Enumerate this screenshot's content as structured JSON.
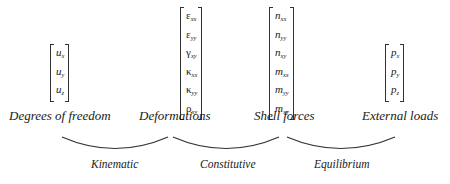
{
  "vectors": {
    "dof": {
      "entries": [
        {
          "sym": "u",
          "sub": "x"
        },
        {
          "sym": "u",
          "sub": "y"
        },
        {
          "sym": "u",
          "sub": "z"
        }
      ]
    },
    "deformations": {
      "entries": [
        {
          "sym": "ε",
          "sub": "xx"
        },
        {
          "sym": "ε",
          "sub": "yy"
        },
        {
          "sym": "γ",
          "sub": "xy"
        },
        {
          "sym": "κ",
          "sub": "xx"
        },
        {
          "sym": "κ",
          "sub": "yy"
        },
        {
          "sym": "ρ",
          "sub": "xy"
        }
      ]
    },
    "shell_forces": {
      "entries": [
        {
          "sym": "n",
          "sub": "xx"
        },
        {
          "sym": "n",
          "sub": "yy"
        },
        {
          "sym": "n",
          "sub": "xy"
        },
        {
          "sym": "m",
          "sub": "xx"
        },
        {
          "sym": "m",
          "sub": "yy"
        },
        {
          "sym": "m",
          "sub": "xy"
        }
      ]
    },
    "external_loads": {
      "entries": [
        {
          "sym": "p",
          "sub": "x"
        },
        {
          "sym": "p",
          "sub": "y"
        },
        {
          "sym": "p",
          "sub": "z"
        }
      ]
    }
  },
  "labels": {
    "dof": "Degrees of freedom",
    "deformations": "Deformations",
    "shell_forces": "Shell forces",
    "external_loads": "External loads"
  },
  "relations": {
    "kinematic": "Kinematic",
    "constitutive": "Constitutive",
    "equilibrium": "Equilibrium"
  },
  "colors": {
    "text": "#1a1a1a",
    "lines": "#333333",
    "background": "#ffffff"
  }
}
